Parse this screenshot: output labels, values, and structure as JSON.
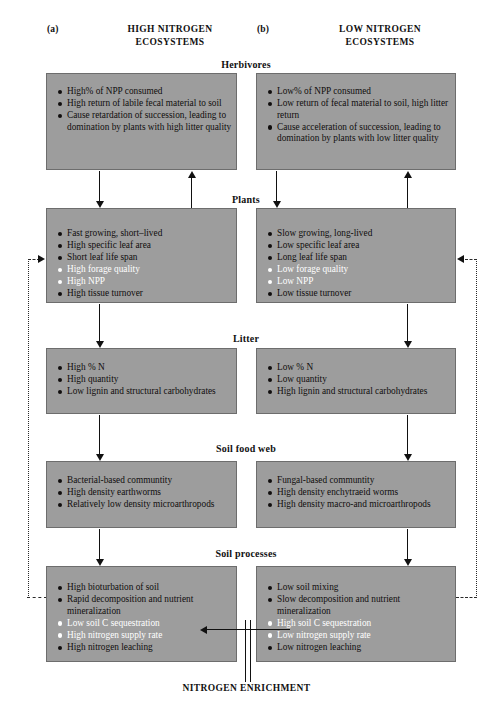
{
  "figure": {
    "columns": [
      {
        "tag": "(a)",
        "title_line1": "HIGH NITROGEN",
        "title_line2": "ECOSYSTEMS"
      },
      {
        "tag": "(b)",
        "title_line1": "LOW NITROGEN",
        "title_line2": "ECOSYSTEMS"
      }
    ],
    "footer_label": "NITROGEN ENRICHMENT",
    "box_fill_color": "#9d9d9d",
    "box_border_color": "#6d6d6d",
    "highlight_text_color": "#ffffff",
    "body_text_color": "#100d0d",
    "stages": [
      {
        "label": "Herbivores",
        "left": [
          {
            "text": "High% of NPP consumed",
            "emphasis": false
          },
          {
            "text": "High return of labile fecal material to soil",
            "emphasis": false
          },
          {
            "text": "Cause retardation of succession, leading to domination by plants with high litter quality",
            "emphasis": false
          }
        ],
        "right": [
          {
            "text": "Low% of NPP consumed",
            "emphasis": false
          },
          {
            "text": "Low return of  fecal material to soil, high litter return",
            "emphasis": false
          },
          {
            "text": "Cause acceleration of succession, leading to domination by plants with low litter quality",
            "emphasis": false
          }
        ]
      },
      {
        "label": "Plants",
        "left": [
          {
            "text": "Fast growing, short–lived",
            "emphasis": false
          },
          {
            "text": "High specific leaf area",
            "emphasis": false
          },
          {
            "text": "Short leaf life span",
            "emphasis": false
          },
          {
            "text": "High forage quality",
            "emphasis": true
          },
          {
            "text": "High NPP",
            "emphasis": true
          },
          {
            "text": "High tissue turnover",
            "emphasis": false
          }
        ],
        "right": [
          {
            "text": "Slow growing, long-lived",
            "emphasis": false
          },
          {
            "text": "Low specific leaf area",
            "emphasis": false
          },
          {
            "text": "Long leaf life span",
            "emphasis": false
          },
          {
            "text": "Low forage quality",
            "emphasis": true
          },
          {
            "text": "Low NPP",
            "emphasis": true
          },
          {
            "text": "Low tissue turnover",
            "emphasis": false
          }
        ]
      },
      {
        "label": "Litter",
        "left": [
          {
            "text": "High % N",
            "emphasis": false
          },
          {
            "text": "High quantity",
            "emphasis": false
          },
          {
            "text": "Low lignin and structural carbohydrates",
            "emphasis": false
          }
        ],
        "right": [
          {
            "text": "Low % N",
            "emphasis": false
          },
          {
            "text": "Low quantity",
            "emphasis": false
          },
          {
            "text": "High lignin and structural carbohydrates",
            "emphasis": false
          }
        ]
      },
      {
        "label": "Soil food web",
        "left": [
          {
            "text": "Bacterial-based communtity",
            "emphasis": false
          },
          {
            "text": "High density earthworms",
            "emphasis": false
          },
          {
            "text": "Relatively low density microarthropods",
            "emphasis": false
          }
        ],
        "right": [
          {
            "text": "Fungal-based communtity",
            "emphasis": false
          },
          {
            "text": "High density enchytraeid worms",
            "emphasis": false
          },
          {
            "text": "High density macro-and microarthropods",
            "emphasis": false
          }
        ]
      },
      {
        "label": "Soil processes",
        "left": [
          {
            "text": "High bioturbation of soil",
            "emphasis": false
          },
          {
            "text": "Rapid decomposition and nutrient mineralization",
            "emphasis": false
          },
          {
            "text": "Low soil C sequestration",
            "emphasis": true
          },
          {
            "text": "High nitrogen supply rate",
            "emphasis": true
          },
          {
            "text": "High nitrogen leaching",
            "emphasis": false
          }
        ],
        "right": [
          {
            "text": "Low soil mixing",
            "emphasis": false
          },
          {
            "text": "Slow decomposition and nutrient mineralization",
            "emphasis": false
          },
          {
            "text": "High soil C sequestration",
            "emphasis": true
          },
          {
            "text": "Low nitrogen supply rate",
            "emphasis": true
          },
          {
            "text": "Low nitrogen leaching",
            "emphasis": false
          }
        ]
      }
    ]
  }
}
